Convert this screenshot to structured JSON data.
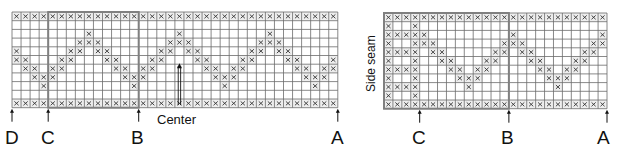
{
  "left_chart": {
    "cols": 36,
    "rows": 11,
    "cell_w": 9.05,
    "cell_h": 8.7,
    "origin": [
      12,
      12
    ],
    "highlight_box": {
      "col_start": 4,
      "col_end": 14,
      "row_start": 0,
      "row_end": 11
    },
    "full_rows": [
      0,
      10
    ],
    "diamond": {
      "peaks": [
        8,
        18,
        28,
        38,
        -2
      ],
      "peak_row": 2
    },
    "markers": [
      {
        "label": "D",
        "col_edge": 0
      },
      {
        "label": "C",
        "col_edge": 4
      },
      {
        "label": "B",
        "col_edge": 14
      },
      {
        "label": "A",
        "col_edge": 36
      }
    ],
    "center": {
      "label": "Center",
      "col": 18
    }
  },
  "right_chart": {
    "cols": 25,
    "rows": 11,
    "cell_w": 8.92,
    "cell_h": 8.7,
    "origin": [
      384,
      13
    ],
    "highlight_box": {
      "col_start": 0,
      "col_end": 14,
      "row_start": 0,
      "row_end": 11
    },
    "full_rows": [
      0,
      10
    ],
    "side_seam": {
      "cols": [
        0,
        3
      ],
      "full_rows": [
        2,
        4,
        6,
        8
      ]
    },
    "diamond": {
      "peaks": [
        4,
        14,
        24
      ],
      "peak_row": 2,
      "min_col": 4
    },
    "markers": [
      {
        "label": "C",
        "col_edge": 4
      },
      {
        "label": "B",
        "col_edge": 14
      },
      {
        "label": "A",
        "col_edge": 25
      }
    ],
    "side_label": "Side seam"
  },
  "colors": {
    "grid": "#6b6b6b",
    "box": "#808080",
    "x": "#333333",
    "full_bg": "#eeeeee"
  },
  "labels": {
    "left": {
      "D": "D",
      "C": "C",
      "B": "B",
      "A": "A",
      "center": "Center"
    },
    "right": {
      "C": "C",
      "B": "B",
      "A": "A",
      "side": "Side seam"
    }
  }
}
